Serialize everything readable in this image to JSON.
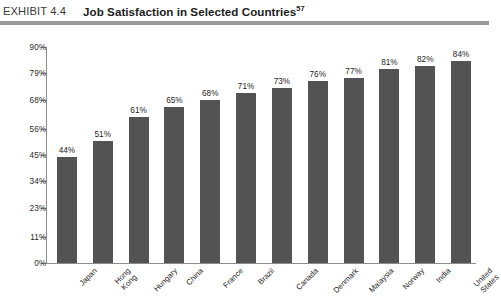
{
  "header": {
    "exhibit_label": "EXHIBIT 4.4",
    "title": "Job Satisfaction in Selected Countries",
    "superscript": "57"
  },
  "colors": {
    "bar": "#535353",
    "axis": "#8c8c8c",
    "rule": "#9a9a9a",
    "text": "#1d1d1d",
    "background": "#ffffff"
  },
  "chart_data": {
    "type": "bar",
    "title": "Job Satisfaction in Selected Countries",
    "xlabel": "",
    "ylabel": "",
    "ylim": [
      0,
      90
    ],
    "grid": false,
    "legend": null,
    "ytick_labels": [
      "0%",
      "11%",
      "23%",
      "34%",
      "45%",
      "56%",
      "68%",
      "79%",
      "90%"
    ],
    "ytick_values": [
      0,
      11,
      23,
      34,
      45,
      56,
      68,
      79,
      90
    ],
    "categories": [
      "Japan",
      "Hong Kong",
      "Hungary",
      "China",
      "France",
      "Brazil",
      "Canada",
      "Denmark",
      "Malaysia",
      "Norway",
      "India",
      "United States"
    ],
    "category_lines": [
      [
        "Japan"
      ],
      [
        "Hong",
        "Kong"
      ],
      [
        "Hungary"
      ],
      [
        "China"
      ],
      [
        "France"
      ],
      [
        "Brazil"
      ],
      [
        "Canada"
      ],
      [
        "Denmark"
      ],
      [
        "Malaysia"
      ],
      [
        "Norway"
      ],
      [
        "India"
      ],
      [
        "United",
        "States"
      ]
    ],
    "values": [
      44,
      51,
      61,
      65,
      68,
      71,
      73,
      76,
      77,
      81,
      82,
      84
    ],
    "value_labels": [
      "44%",
      "51%",
      "61%",
      "65%",
      "68%",
      "71%",
      "73%",
      "76%",
      "77%",
      "81%",
      "82%",
      "84%"
    ]
  }
}
